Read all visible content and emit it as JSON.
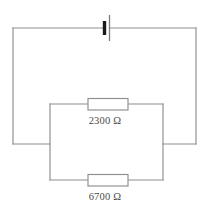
{
  "figure": {
    "type": "electrical-circuit-schematic",
    "background_color": "#ffffff",
    "wire_color": "#8e8e8e",
    "label_color": "#4a4a4a",
    "battery_terminal_color": "#1a1a1a"
  },
  "components": {
    "battery": {
      "name": "battery",
      "label": "",
      "position": "top-center"
    },
    "resistor_top": {
      "name": "resistor-top",
      "value": "2300",
      "unit": "Ω",
      "label": "2300 Ω",
      "position": "inner-loop-top-branch"
    },
    "resistor_bottom": {
      "name": "resistor-bottom",
      "value": "6700",
      "unit": "Ω",
      "label": "6700 Ω",
      "position": "inner-loop-bottom-branch"
    }
  },
  "labels": {
    "top_resistor": "2300 Ω",
    "bottom_resistor": "6700 Ω"
  }
}
